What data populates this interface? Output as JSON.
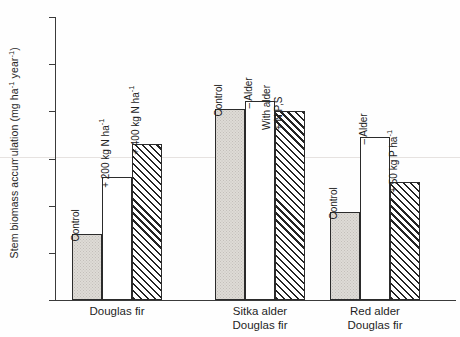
{
  "chart_data": {
    "type": "bar",
    "title": "",
    "xlabel": "",
    "ylabel": "Stem biomass accumulation (mg ha-1 year-1)",
    "ylabel_parts": {
      "base": "Stem biomass accumulation (mg ha",
      "sup1": "-1",
      "mid": " year",
      "sup2": "-1",
      "close": ")"
    },
    "ylim": [
      0,
      12
    ],
    "yticks": [
      0,
      2,
      4,
      6,
      8,
      10,
      12
    ],
    "ytick_labels": [
      "0",
      "2",
      "4",
      "6",
      "8",
      "10",
      "12"
    ],
    "grid": false,
    "legend": "none",
    "groups": [
      {
        "name": "Douglas fir",
        "label_lines": [
          "Douglas fir"
        ],
        "bars": [
          {
            "label": "Control",
            "label_lines": [
              "Control"
            ],
            "value": 2.8,
            "fill": "stipple"
          },
          {
            "label": "+ 200 kg N ha-1",
            "label_lines": [
              "+ 200 kg N ha"
            ],
            "sup": "-1",
            "value": 5.2,
            "fill": "white"
          },
          {
            "label": "+ 400 kg N ha-1",
            "label_lines": [
              "+ 400 kg N ha"
            ],
            "sup": "-1",
            "value": 6.6,
            "fill": "hatch"
          }
        ]
      },
      {
        "name": "Sitka alder Douglas fir",
        "label_lines": [
          "Sitka alder",
          "Douglas fir"
        ],
        "bars": [
          {
            "label": "Control",
            "label_lines": [
              "Control"
            ],
            "value": 8.1,
            "fill": "stipple"
          },
          {
            "label": "- Alder",
            "label_lines": [
              "– Alder"
            ],
            "value": 8.45,
            "fill": "white"
          },
          {
            "label": "With alder + N,P,S",
            "label_lines": [
              "With alder",
              "+ N,P,S"
            ],
            "value": 8.0,
            "fill": "hatch"
          }
        ]
      },
      {
        "name": "Red alder Douglas fir",
        "label_lines": [
          "Red alder",
          "Douglas fir"
        ],
        "bars": [
          {
            "label": "Control",
            "label_lines": [
              "Control"
            ],
            "value": 3.75,
            "fill": "stipple"
          },
          {
            "label": "- Alder",
            "label_lines": [
              "– Alder"
            ],
            "value": 6.9,
            "fill": "white"
          },
          {
            "label": "+ 50 kg P ha-1",
            "label_lines": [
              "+ 50 kg P ha"
            ],
            "sup": "-1",
            "value": 5.0,
            "fill": "hatch"
          }
        ]
      }
    ],
    "colors": {
      "axis": "#3a3a3a",
      "bar_outline": "#2b2b2b",
      "stipple_fill": "#dedbd6",
      "white_fill": "#ffffff",
      "hatch_line": "#242424",
      "background": "#fefefe"
    }
  }
}
